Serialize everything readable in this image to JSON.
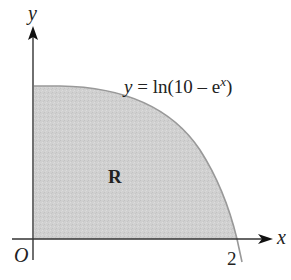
{
  "diagram": {
    "axes": {
      "x_label": "x",
      "y_label": "y",
      "origin_label": "O",
      "x_tick_label": "2"
    },
    "curve": {
      "equation_y": "y",
      "equation_rest": " = ln(10 – e",
      "equation_exp": "x",
      "equation_close": ")"
    },
    "region": {
      "label": "R",
      "fill_color": "#cfcfcf"
    },
    "colors": {
      "axis": "#333333",
      "curve": "#999999"
    }
  }
}
